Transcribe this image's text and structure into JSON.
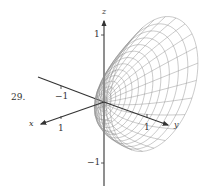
{
  "problem_number": "29.",
  "chart_data": {
    "type": "surface3d",
    "title": "",
    "surface": "paraboloid opening along +y (y = x^2 + z^2), wireframe mesh",
    "axes": {
      "x": {
        "label": "x",
        "ticks": [
          {
            "value": 1,
            "label": "1"
          }
        ]
      },
      "y": {
        "label": "y",
        "ticks": [
          {
            "value": -1,
            "label": "−1"
          },
          {
            "value": 1,
            "label": "1"
          }
        ]
      },
      "z": {
        "label": "z",
        "ticks": [
          {
            "value": 1,
            "label": "1"
          },
          {
            "value": -1,
            "label": "−1"
          }
        ]
      }
    },
    "mesh": {
      "rings": 14,
      "radial_lines": 24
    },
    "grid": false,
    "legend": null
  },
  "labels": {
    "x_axis": "x",
    "y_axis": "y",
    "z_axis": "z",
    "z_tick_pos": "1",
    "z_tick_neg": "−1",
    "y_tick_neg": "−1",
    "y_tick_pos": "1",
    "x_tick_pos": "1"
  },
  "geometry": {
    "origin": [
      104,
      102
    ],
    "rim_center": [
      154,
      84
    ],
    "rim_axis_a": [
      22,
      -66
    ],
    "rim_axis_b": [
      38,
      14
    ],
    "mesh_color": "#8a8a8a",
    "axis_color": "#333333"
  }
}
